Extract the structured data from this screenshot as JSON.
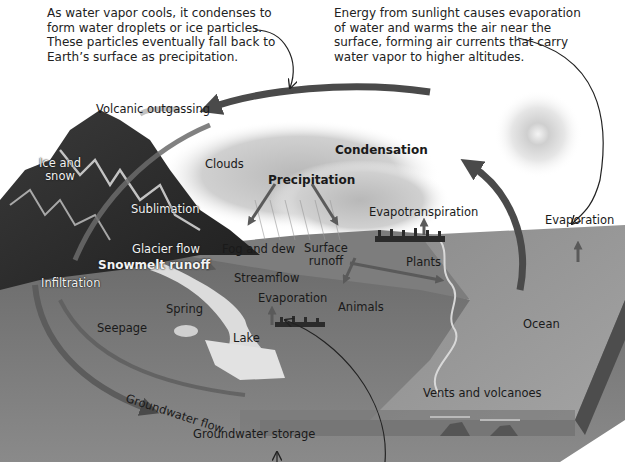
{
  "captions": {
    "condensation_note": {
      "lines": [
        "As water vapor cools, it condenses to",
        "form water droplets or ice particles.",
        "These particles eventually fall back to",
        "Earth’s surface as precipitation."
      ]
    },
    "evaporation_note": {
      "lines": [
        "Energy from sunlight causes evaporation",
        "of water and warms the air near the",
        "surface, forming air currents that carry",
        "water vapor to higher altitudes."
      ]
    }
  },
  "labels": {
    "volcanic_outgassing": "Volcanic outgassing",
    "ice_and_snow_1": "Ice and",
    "ice_and_snow_2": "snow",
    "clouds": "Clouds",
    "condensation": "Condensation",
    "precipitation": "Precipitation",
    "sublimation": "Sublimation",
    "evapotranspiration": "Evapotranspiration",
    "evaporation_ocean": "Evaporation",
    "glacier_flow": "Glacier flow",
    "fog_and_dew": "Fog and dew",
    "surface_runoff_1": "Surface",
    "surface_runoff_2": "runoff",
    "snowmelt_runoff": "Snowmelt runoff",
    "plants": "Plants",
    "streamflow": "Streamflow",
    "infiltration": "Infiltration",
    "evaporation_lake": "Evaporation",
    "animals": "Animals",
    "spring": "Spring",
    "seepage": "Seepage",
    "lake": "Lake",
    "ocean": "Ocean",
    "groundwater_flow": "Groundwater flow",
    "vents_and_volcanoes": "Vents and volcanoes",
    "groundwater_storage": "Groundwater storage"
  },
  "colors": {
    "arrow": "#4a4a4a",
    "ground": "#6e6e6e",
    "ocean": "#8a8a8a",
    "sky": "#ffffff"
  }
}
